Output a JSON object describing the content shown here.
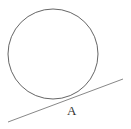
{
  "diagram": {
    "circle": {
      "cx": 53,
      "cy": 54,
      "r": 45,
      "stroke": "#666666"
    },
    "tangent_line": {
      "x1": 8,
      "y1": 122,
      "x2": 123,
      "y2": 79,
      "stroke": "#888888"
    },
    "points": [
      {
        "label": "A",
        "x": 69,
        "y": 104
      }
    ]
  }
}
